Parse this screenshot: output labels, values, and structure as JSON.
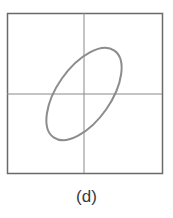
{
  "figure": {
    "caption": "(d)",
    "frame": {
      "x": 7,
      "y": 13,
      "width": 155,
      "height": 160,
      "color": "#6a6a6a"
    },
    "axes": {
      "cx": 84,
      "cy": 94,
      "color": "#7a7a7a"
    },
    "ellipse": {
      "cx": 84,
      "cy": 94,
      "rx": 52,
      "ry": 27,
      "rotation": -55,
      "color": "#8a8a8a"
    }
  }
}
